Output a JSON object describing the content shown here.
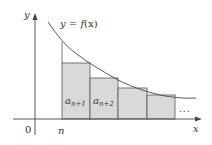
{
  "diagram": {
    "curve_label": "y = f(x)",
    "curve_label_parts": {
      "y": "y",
      "eq": " = ",
      "f": "f",
      "x_arg": "(x)"
    },
    "y_axis_label": "y",
    "x_axis_label": "x",
    "origin_label": "0",
    "n_label": "n",
    "rect_labels": [
      {
        "base": "a",
        "sub": "n+1"
      },
      {
        "base": "a",
        "sub": "n+2"
      }
    ],
    "ellipsis": "...",
    "colors": {
      "rect_fill": "#d9d9d9",
      "stroke": "#444444",
      "background": "#ffffff"
    }
  }
}
